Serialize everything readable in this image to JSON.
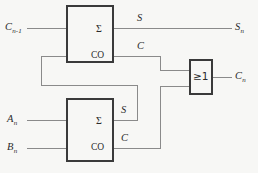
{
  "diagram": {
    "background_color": "#f7f7f5",
    "wire_color": "#8a8a8a",
    "block_stroke_color": "#3a3a3a",
    "text_color": "#2b2b2b"
  },
  "inputs": {
    "carry_in": {
      "base": "C",
      "sub": "n-1"
    },
    "a_input": {
      "base": "A",
      "sub": "n"
    },
    "b_input": {
      "base": "B",
      "sub": "n"
    }
  },
  "outputs": {
    "sum_out": {
      "base": "S",
      "sub": "n"
    },
    "carry_out": {
      "base": "C",
      "sub": "n"
    }
  },
  "top_adder": {
    "name": "half-adder-upper",
    "sum_port": "Σ",
    "carry_port": "CO",
    "sum_wire_label": "S",
    "carry_wire_label": "C"
  },
  "bottom_adder": {
    "name": "half-adder-lower",
    "sum_port": "Σ",
    "carry_port": "CO",
    "sum_wire_label": "S",
    "carry_wire_label": "C"
  },
  "or_gate": {
    "name": "or-gate",
    "symbol": "≥1"
  }
}
